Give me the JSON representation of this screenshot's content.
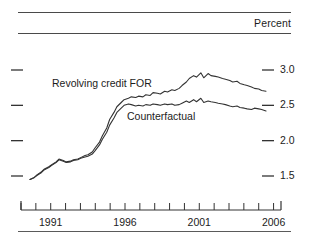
{
  "figure": {
    "unit_label": "Percent",
    "y_axis": {
      "min": 1.25,
      "max": 3.15,
      "ticks": [
        "3.0",
        "2.5",
        "2.0",
        "1.5"
      ],
      "tick_values": [
        3.0,
        2.5,
        2.0,
        1.5
      ]
    },
    "x_axis": {
      "min": 1989.0,
      "max": 2006.5,
      "labels": [
        "1991",
        "1996",
        "2001",
        "2006"
      ],
      "label_values": [
        1991,
        1996,
        2001,
        2006
      ],
      "tick_values": [
        1989,
        1990,
        1991,
        1992,
        1993,
        1994,
        1995,
        1996,
        1997,
        1998,
        1999,
        2000,
        2001,
        2002,
        2003,
        2004,
        2005,
        2006
      ]
    },
    "series_labels": {
      "revolving": "Revolving credit FOR",
      "counterfactual": "Counterfactual"
    },
    "colors": {
      "line": "#333333",
      "rule": "#4a4a4a",
      "text": "#1c1c1c"
    }
  },
  "chart_data": {
    "type": "line",
    "title": "",
    "subtitle": "",
    "xlabel": "",
    "ylabel": "Percent",
    "xlim": [
      1989.0,
      2006.5
    ],
    "ylim": [
      1.25,
      3.15
    ],
    "grid": false,
    "legend": "inline-annotations",
    "annotations": [
      {
        "text": "Revolving credit FOR",
        "x": 1993.2,
        "y": 2.82
      },
      {
        "text": "Counterfactual",
        "x": 1997.8,
        "y": 2.37
      }
    ],
    "x": [
      1989.6,
      1989.9,
      1990.1,
      1990.4,
      1990.6,
      1990.9,
      1991.1,
      1991.4,
      1991.6,
      1991.9,
      1992.1,
      1992.4,
      1992.6,
      1992.9,
      1993.1,
      1993.4,
      1993.6,
      1993.9,
      1994.1,
      1994.4,
      1994.6,
      1994.9,
      1995.1,
      1995.4,
      1995.6,
      1995.9,
      1996.1,
      1996.4,
      1996.6,
      1996.9,
      1997.1,
      1997.4,
      1997.6,
      1997.9,
      1998.1,
      1998.4,
      1998.6,
      1998.9,
      1999.1,
      1999.4,
      1999.6,
      1999.9,
      2000.1,
      2000.4,
      2000.6,
      2000.9,
      2001.1,
      2001.4,
      2001.6,
      2001.9,
      2002.1,
      2002.4,
      2002.6,
      2002.9,
      2003.1,
      2003.4,
      2003.6,
      2003.9,
      2004.1,
      2004.4,
      2004.6,
      2004.9,
      2005.1,
      2005.4,
      2005.6,
      2005.9
    ],
    "series": [
      {
        "name": "Revolving credit FOR",
        "values": [
          1.45,
          1.48,
          1.52,
          1.56,
          1.6,
          1.63,
          1.66,
          1.7,
          1.74,
          1.72,
          1.7,
          1.71,
          1.73,
          1.74,
          1.76,
          1.79,
          1.8,
          1.84,
          1.9,
          1.98,
          2.07,
          2.18,
          2.3,
          2.4,
          2.48,
          2.54,
          2.58,
          2.6,
          2.62,
          2.61,
          2.63,
          2.62,
          2.65,
          2.64,
          2.68,
          2.67,
          2.66,
          2.7,
          2.69,
          2.72,
          2.71,
          2.74,
          2.78,
          2.83,
          2.88,
          2.92,
          2.9,
          2.96,
          2.89,
          2.95,
          2.92,
          2.91,
          2.9,
          2.88,
          2.87,
          2.85,
          2.83,
          2.84,
          2.81,
          2.79,
          2.78,
          2.76,
          2.74,
          2.73,
          2.71,
          2.7
        ]
      },
      {
        "name": "Counterfactual",
        "values": [
          1.45,
          1.48,
          1.51,
          1.55,
          1.59,
          1.62,
          1.65,
          1.69,
          1.73,
          1.71,
          1.69,
          1.7,
          1.72,
          1.73,
          1.75,
          1.77,
          1.78,
          1.81,
          1.86,
          1.94,
          2.02,
          2.12,
          2.22,
          2.32,
          2.4,
          2.46,
          2.5,
          2.52,
          2.51,
          2.49,
          2.5,
          2.49,
          2.51,
          2.5,
          2.52,
          2.51,
          2.5,
          2.52,
          2.51,
          2.52,
          2.5,
          2.51,
          2.53,
          2.56,
          2.54,
          2.58,
          2.55,
          2.6,
          2.54,
          2.56,
          2.55,
          2.54,
          2.53,
          2.52,
          2.51,
          2.49,
          2.48,
          2.49,
          2.47,
          2.46,
          2.45,
          2.44,
          2.46,
          2.45,
          2.44,
          2.42
        ]
      }
    ]
  }
}
